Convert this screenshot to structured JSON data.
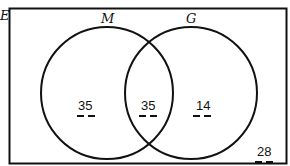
{
  "diagram": {
    "type": "venn",
    "universal_label": "E",
    "sets": [
      {
        "name": "M",
        "only": "35"
      },
      {
        "name": "G",
        "only": "14"
      }
    ],
    "intersection": "35",
    "outside": "28"
  }
}
